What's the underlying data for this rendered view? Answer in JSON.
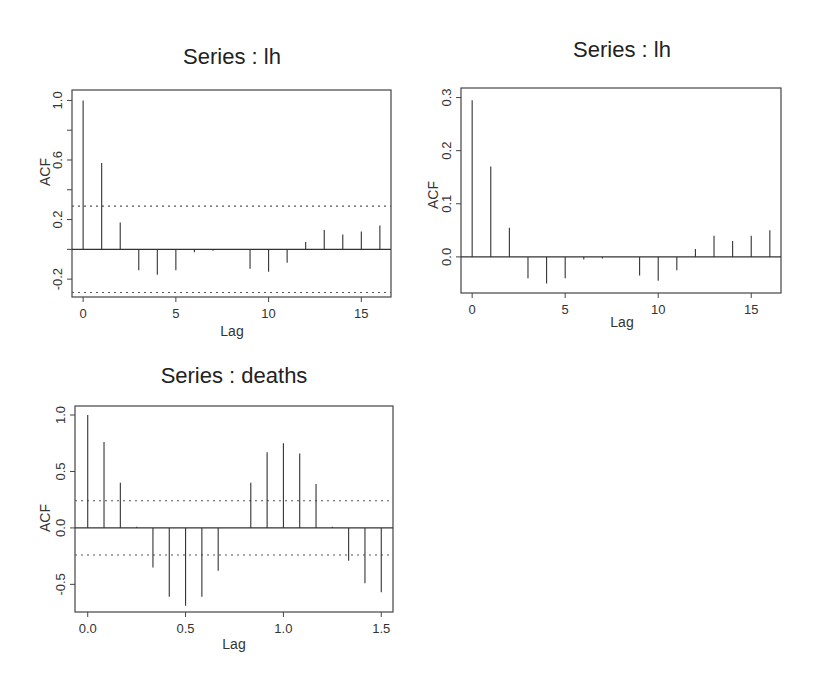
{
  "chart_data": [
    {
      "id": "acf-lh",
      "type": "bar",
      "subtype": "acf-spike",
      "title": "Series : lh",
      "xlabel": "Lag",
      "ylabel": "ACF",
      "xlim": [
        -0.6,
        16.6
      ],
      "ylim": [
        -0.32,
        1.07
      ],
      "xticks": [
        0,
        5,
        10,
        15
      ],
      "xtick_labels": [
        "0",
        "5",
        "10",
        "15"
      ],
      "yticks": [
        -0.2,
        0.0,
        0.2,
        0.4,
        0.6,
        0.8,
        1.0
      ],
      "ytick_labels": [
        "-0.2",
        "",
        "0.2",
        "",
        "0.6",
        "",
        "1.0"
      ],
      "x": [
        0,
        1,
        2,
        3,
        4,
        5,
        6,
        7,
        8,
        9,
        10,
        11,
        12,
        13,
        14,
        15,
        16
      ],
      "values": [
        1.0,
        0.58,
        0.18,
        -0.14,
        -0.17,
        -0.14,
        -0.02,
        -0.01,
        0.0,
        -0.13,
        -0.15,
        -0.09,
        0.05,
        0.13,
        0.1,
        0.12,
        0.16
      ],
      "confidence_band": [
        0.29,
        -0.29
      ],
      "grid": false,
      "legend": null,
      "frame": {
        "left": 72,
        "top": 90,
        "right": 391,
        "bottom": 297
      }
    },
    {
      "id": "pacf-lh",
      "type": "bar",
      "subtype": "acf-spike",
      "title": "Series : lh",
      "xlabel": "Lag",
      "ylabel": "ACF",
      "xlim": [
        -0.6,
        16.6
      ],
      "ylim": [
        -0.068,
        0.318
      ],
      "xticks": [
        0,
        5,
        10,
        15
      ],
      "xtick_labels": [
        "0",
        "5",
        "10",
        "15"
      ],
      "yticks": [
        0.0,
        0.1,
        0.2,
        0.3
      ],
      "ytick_labels": [
        "0.0",
        "0.1",
        "0.2",
        "0.3"
      ],
      "x": [
        0,
        1,
        2,
        3,
        4,
        5,
        6,
        7,
        8,
        9,
        10,
        11,
        12,
        13,
        14,
        15,
        16
      ],
      "values": [
        0.295,
        0.17,
        0.055,
        -0.04,
        -0.05,
        -0.04,
        -0.005,
        -0.003,
        0.0,
        -0.035,
        -0.045,
        -0.025,
        0.015,
        0.04,
        0.03,
        0.04,
        0.05
      ],
      "confidence_band": null,
      "grid": false,
      "legend": null,
      "frame": {
        "left": 461,
        "top": 88,
        "right": 781,
        "bottom": 293
      }
    },
    {
      "id": "acf-deaths",
      "type": "bar",
      "subtype": "acf-spike",
      "title": "Series : deaths",
      "xlabel": "Lag",
      "ylabel": "ACF",
      "xlim": [
        -0.065,
        1.56
      ],
      "ylim": [
        -0.745,
        1.08
      ],
      "xticks": [
        0.0,
        0.5,
        1.0,
        1.5
      ],
      "xtick_labels": [
        "0.0",
        "0.5",
        "1.0",
        "1.5"
      ],
      "yticks": [
        -0.5,
        0.0,
        0.5,
        1.0
      ],
      "ytick_labels": [
        "-0.5",
        "0.0",
        "0.5",
        "1.0"
      ],
      "x": [
        0.0,
        0.0833,
        0.1667,
        0.25,
        0.3333,
        0.4167,
        0.5,
        0.5833,
        0.6667,
        0.75,
        0.8333,
        0.9167,
        1.0,
        1.0833,
        1.1667,
        1.25,
        1.3333,
        1.4167,
        1.5
      ],
      "values": [
        1.0,
        0.76,
        0.4,
        0.01,
        -0.35,
        -0.61,
        -0.69,
        -0.61,
        -0.38,
        0.0,
        0.4,
        0.67,
        0.75,
        0.66,
        0.39,
        0.01,
        -0.29,
        -0.49,
        -0.57
      ],
      "confidence_band": [
        0.24,
        -0.24
      ],
      "grid": false,
      "legend": null,
      "frame": {
        "left": 75,
        "top": 406,
        "right": 393,
        "bottom": 612
      }
    }
  ]
}
